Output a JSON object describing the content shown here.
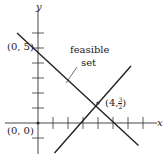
{
  "axes": {
    "x_label": "x",
    "y_label": "y"
  },
  "points": {
    "origin": "(0, 0)",
    "y_intercept": "(0, 5)",
    "intersection_prefix": "(4,",
    "intersection_num": "3",
    "intersection_den": "2",
    "intersection_suffix": ")"
  },
  "annotation": {
    "line1": "feasible",
    "line2": "set"
  },
  "lines": [
    {
      "name": "decreasing-line",
      "from": [
        -1.4,
        6.0
      ],
      "to": [
        6.7,
        -1.5
      ]
    },
    {
      "name": "increasing-line",
      "from": [
        1.1,
        -2.0
      ],
      "to": [
        6.2,
        3.8
      ]
    }
  ],
  "ticks": {
    "x": [
      1,
      2,
      3,
      4,
      5,
      6,
      7
    ],
    "y": [
      -1,
      1,
      2,
      3,
      4,
      5,
      6
    ]
  }
}
